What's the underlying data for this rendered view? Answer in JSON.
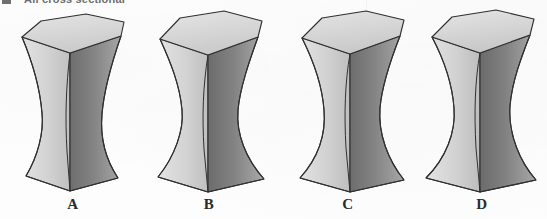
{
  "figure": {
    "caption": "All cross sectional",
    "caption_bullet_icon": "square-bullet-icon",
    "background_color": "#fdfdfd",
    "ink_color": "#2b2b2b"
  },
  "palette": {
    "top_face": "#dcdcdc",
    "top_face_shade": "#cfcfcf",
    "left_face_light": "#d5d5d5",
    "left_face_mid": "#c3c3c3",
    "right_face_dark": "#888888",
    "right_face_darker": "#6f6f6f",
    "outline": "#2f2f2f"
  },
  "solids": [
    {
      "id": "solid-a",
      "label": "A",
      "label_x": 73,
      "x": 8,
      "waist_y": 0.52,
      "waist_width": 0.4,
      "description": "hourglass solid with hexagonal top face, single broad waist near mid-height"
    },
    {
      "id": "solid-b",
      "label": "B",
      "label_x": 209,
      "x": 148,
      "waist_y": 0.5,
      "waist_width": 0.34,
      "description": "hourglass solid with hexagonal top face, narrower waist, flared base"
    },
    {
      "id": "solid-c",
      "label": "C",
      "label_x": 348,
      "x": 288,
      "waist_y": 0.42,
      "waist_width": 0.36,
      "description": "hourglass solid with hexagonal top face, waist set higher, pronounced double curve"
    },
    {
      "id": "solid-d",
      "label": "D",
      "label_x": 482,
      "x": 418,
      "waist_y": 0.44,
      "waist_width": 0.33,
      "description": "hourglass solid with hexagonal top face, tight high waist, wide flared base"
    }
  ]
}
